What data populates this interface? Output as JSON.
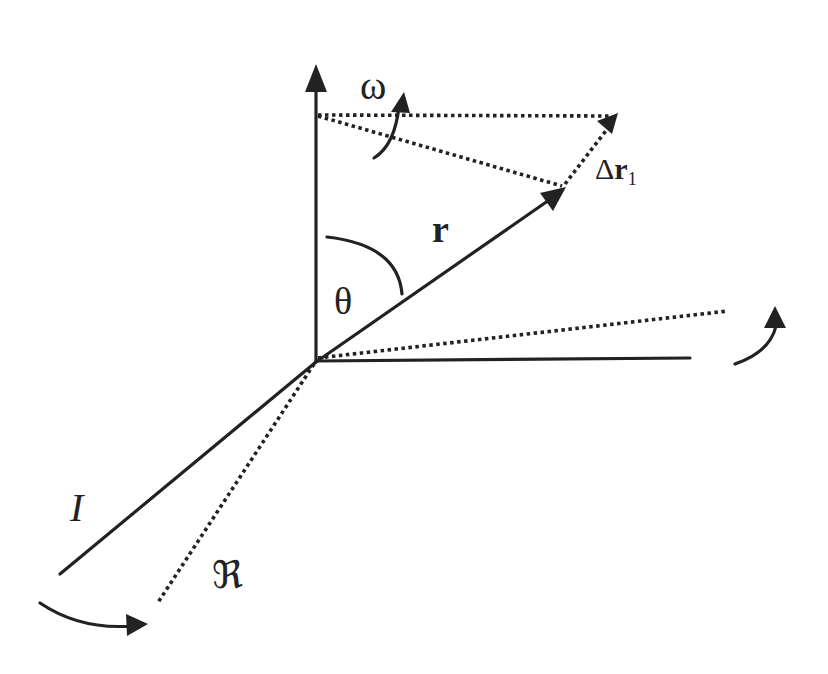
{
  "diagram": {
    "labels": {
      "omega": "ω",
      "r": "r",
      "theta": "θ",
      "delta_r_prefix": "Δ",
      "delta_r_main": "r",
      "delta_r_sub": "1",
      "inertial_frame": "I",
      "rotating_frame": "ℜ"
    },
    "colors": {
      "ink": "#222222",
      "background": "#ffffff"
    },
    "elements": {
      "vertical_axis": "solid arrow, up",
      "horizontal_axis": "solid line, right",
      "inertial_axis": "solid line, lower-left (I)",
      "rotating_axis_horizontal": "dotted line, right slightly up",
      "rotating_axis_depth": "dotted line, lower-left (ℜ)",
      "position_vector": "solid arrow r",
      "displacement_vector": "dotted arrow Δr1",
      "projection_lines": "dotted lines to top"
    }
  }
}
